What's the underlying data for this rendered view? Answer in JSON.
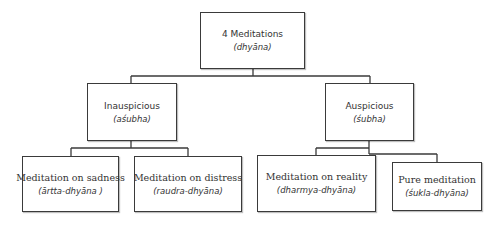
{
  "diagram": {
    "type": "tree",
    "root": {
      "title": "4 Meditations",
      "subtitle": "(dhyāna)"
    },
    "categories": [
      {
        "title": "Inauspicious",
        "subtitle": "(aśubha)",
        "children": [
          {
            "title": "Meditation on sadness",
            "subtitle": "(ārtta-dhyāna )"
          },
          {
            "title": "Meditation on distress",
            "subtitle": "(raudra-dhyāna)"
          }
        ]
      },
      {
        "title": "Auspicious",
        "subtitle": "(śubha)",
        "children": [
          {
            "title": "Meditation on reality",
            "subtitle": "(dharmya-dhyāna)"
          },
          {
            "title": "Pure meditation",
            "subtitle": "(śukla-dhyāna)"
          }
        ]
      }
    ],
    "colors": {
      "border": "#3a3a3a",
      "text": "#333333",
      "background": "#ffffff"
    }
  }
}
